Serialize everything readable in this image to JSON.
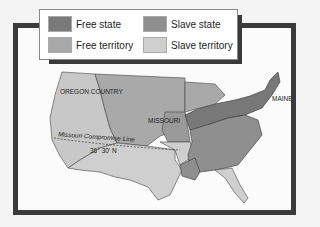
{
  "legend": {
    "items": [
      {
        "label": "Free state",
        "color": "#7a7a7a"
      },
      {
        "label": "Slave state",
        "color": "#8f8f8f"
      },
      {
        "label": "Free territory",
        "color": "#a8a8a8"
      },
      {
        "label": "Slave territory",
        "color": "#cfcfcf"
      }
    ]
  },
  "map": {
    "labels": {
      "oregon": "OREGON COUNTRY",
      "missouri": "MISSOURI",
      "maine": "MAINE",
      "compromise": "Missouri Compromise Line",
      "latitude": "36° 30′ N"
    }
  }
}
